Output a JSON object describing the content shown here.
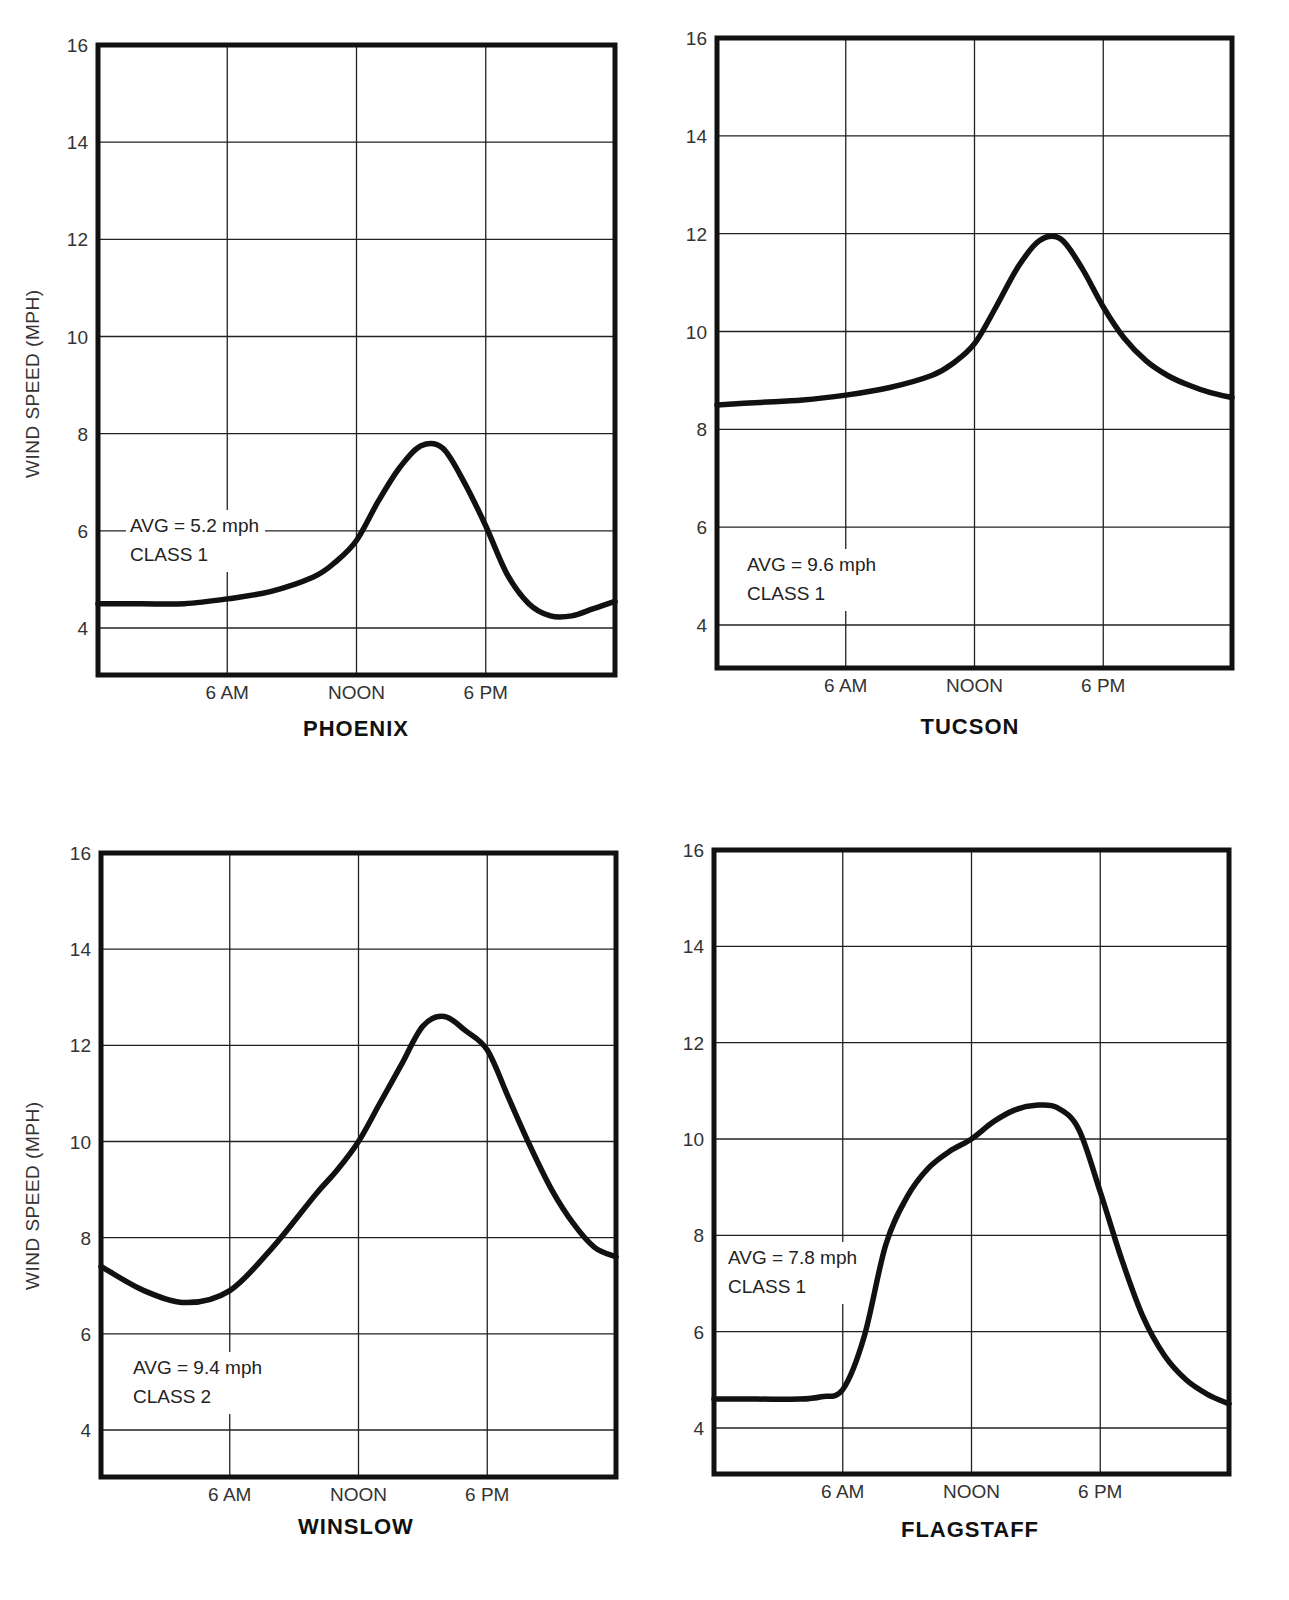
{
  "figure": {
    "y_axis_title": "WIND SPEED (MPH)",
    "x_tick_labels": [
      "6 AM",
      "NOON",
      "6 PM"
    ],
    "y_tick_labels": [
      "4",
      "6",
      "8",
      "10",
      "12",
      "14",
      "16"
    ],
    "colors": {
      "line": "#111111",
      "grid": "#222222",
      "frame": "#111111",
      "text": "#333333"
    }
  },
  "chart_data": [
    {
      "type": "line",
      "title": "PHOENIX",
      "xlabel": "",
      "ylabel": "WIND SPEED (MPH)",
      "x_unit": "hour of day",
      "xlim": [
        0,
        24
      ],
      "ylim": [
        3,
        16
      ],
      "grid": true,
      "xticks": [
        {
          "hour": 6,
          "label": "6 AM"
        },
        {
          "hour": 12,
          "label": "NOON"
        },
        {
          "hour": 18,
          "label": "6 PM"
        }
      ],
      "yticks": [
        4,
        6,
        8,
        10,
        12,
        14,
        16
      ],
      "annotation": {
        "line1": "AVG = 5.2 mph",
        "line2": "CLASS 1"
      },
      "x": [
        0,
        2,
        4,
        6,
        8,
        10,
        11,
        12,
        13,
        14,
        15,
        16,
        17,
        18,
        19,
        20,
        21,
        22,
        23,
        24
      ],
      "values": [
        4.5,
        4.5,
        4.5,
        4.6,
        4.75,
        5.05,
        5.35,
        5.8,
        6.6,
        7.3,
        7.75,
        7.7,
        7.0,
        6.1,
        5.1,
        4.5,
        4.25,
        4.25,
        4.4,
        4.55
      ]
    },
    {
      "type": "line",
      "title": "TUCSON",
      "xlabel": "",
      "ylabel": "",
      "x_unit": "hour of day",
      "xlim": [
        0,
        24
      ],
      "ylim": [
        3,
        16
      ],
      "grid": true,
      "xticks": [
        {
          "hour": 6,
          "label": "6 AM"
        },
        {
          "hour": 12,
          "label": "NOON"
        },
        {
          "hour": 18,
          "label": "6 PM"
        }
      ],
      "yticks": [
        4,
        6,
        8,
        10,
        12,
        14,
        16
      ],
      "annotation": {
        "line1": "AVG = 9.6 mph",
        "line2": "CLASS 1"
      },
      "x": [
        0,
        2,
        4,
        6,
        8,
        10,
        11,
        12,
        13,
        14,
        15,
        16,
        17,
        18,
        19,
        20,
        21,
        22,
        23,
        24
      ],
      "values": [
        8.5,
        8.55,
        8.6,
        8.7,
        8.85,
        9.1,
        9.35,
        9.75,
        10.5,
        11.3,
        11.85,
        11.9,
        11.3,
        10.5,
        9.85,
        9.4,
        9.1,
        8.9,
        8.75,
        8.65
      ]
    },
    {
      "type": "line",
      "title": "WINSLOW",
      "xlabel": "",
      "ylabel": "WIND SPEED (MPH)",
      "x_unit": "hour of day",
      "xlim": [
        0,
        24
      ],
      "ylim": [
        3,
        16
      ],
      "grid": true,
      "xticks": [
        {
          "hour": 6,
          "label": "6 AM"
        },
        {
          "hour": 12,
          "label": "NOON"
        },
        {
          "hour": 18,
          "label": "6 PM"
        }
      ],
      "yticks": [
        4,
        6,
        8,
        10,
        12,
        14,
        16
      ],
      "annotation": {
        "line1": "AVG = 9.4 mph",
        "line2": "CLASS 2"
      },
      "x": [
        0,
        2,
        4,
        6,
        8,
        10,
        11,
        12,
        13,
        14,
        15,
        16,
        17,
        18,
        19,
        20,
        21,
        22,
        23,
        24
      ],
      "values": [
        7.4,
        6.9,
        6.65,
        6.9,
        7.8,
        8.9,
        9.4,
        10.0,
        10.8,
        11.6,
        12.4,
        12.6,
        12.3,
        11.9,
        10.9,
        9.9,
        9.0,
        8.3,
        7.8,
        7.6
      ]
    },
    {
      "type": "line",
      "title": "FLAGSTAFF",
      "xlabel": "",
      "ylabel": "",
      "x_unit": "hour of day",
      "xlim": [
        0,
        24
      ],
      "ylim": [
        3,
        16
      ],
      "grid": true,
      "xticks": [
        {
          "hour": 6,
          "label": "6 AM"
        },
        {
          "hour": 12,
          "label": "NOON"
        },
        {
          "hour": 18,
          "label": "6 PM"
        }
      ],
      "yticks": [
        4,
        6,
        8,
        10,
        12,
        14,
        16
      ],
      "annotation": {
        "line1": "AVG = 7.8 mph",
        "line2": "CLASS 1"
      },
      "x": [
        0,
        2,
        4,
        5,
        6,
        7,
        8,
        9,
        10,
        11,
        12,
        13,
        14,
        15,
        16,
        17,
        18,
        19,
        20,
        21,
        22,
        23,
        24
      ],
      "values": [
        4.6,
        4.6,
        4.6,
        4.65,
        4.8,
        5.9,
        7.8,
        8.8,
        9.4,
        9.75,
        10.0,
        10.35,
        10.6,
        10.7,
        10.65,
        10.2,
        8.9,
        7.5,
        6.3,
        5.5,
        5.0,
        4.7,
        4.5
      ]
    }
  ]
}
